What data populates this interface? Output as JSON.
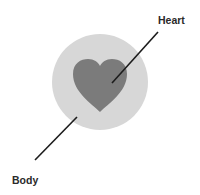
{
  "diagram": {
    "labels": {
      "heart": "Heart",
      "body": "Body"
    },
    "colors": {
      "body_circle": "#d7d7d7",
      "heart": "#7b7b7b",
      "leader_lines": "#1c1c1c",
      "text": "#2a2a2a",
      "background": "#ffffff"
    }
  }
}
